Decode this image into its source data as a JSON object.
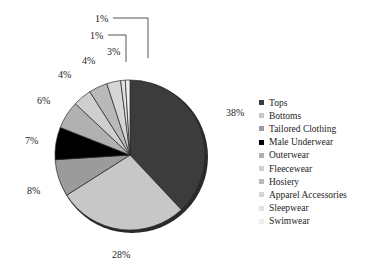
{
  "chart_data": {
    "type": "pie",
    "title": "",
    "legend_position": "right",
    "labels": [
      "Tops",
      "Bottoms",
      "Tailored Clothing",
      "Male Underwear",
      "Outerwear",
      "Fleecewear",
      "Hosiery",
      "Apparel Accessories",
      "Sleepwear",
      "Swimwear"
    ],
    "values": [
      38,
      28,
      8,
      7,
      6,
      4,
      4,
      3,
      1,
      1
    ],
    "value_labels": [
      "38%",
      "28%",
      "8%",
      "7%",
      "6%",
      "4%",
      "4%",
      "3%",
      "1%",
      "1%"
    ],
    "colors": [
      "#3c3c3c",
      "#c7c7c7",
      "#9b9b9b",
      "#000000",
      "#b1b1b1",
      "#cfcfcf",
      "#b9b9b9",
      "#d6d6d6",
      "#e2e2e2",
      "#ededed"
    ],
    "start_angle_deg": 0,
    "direction": "clockwise",
    "slice_outline_color": "#2a2a2a"
  },
  "legend": {
    "items": [
      {
        "label": "Tops",
        "color": "#3c3c3c"
      },
      {
        "label": "Bottoms",
        "color": "#c7c7c7"
      },
      {
        "label": "Tailored Clothing",
        "color": "#9b9b9b"
      },
      {
        "label": "Male Underwear",
        "color": "#000000"
      },
      {
        "label": "Outerwear",
        "color": "#b1b1b1"
      },
      {
        "label": "Fleecewear",
        "color": "#cfcfcf"
      },
      {
        "label": "Hosiery",
        "color": "#b9b9b9"
      },
      {
        "label": "Apparel Accessories",
        "color": "#d6d6d6"
      },
      {
        "label": "Sleepwear",
        "color": "#e2e2e2"
      },
      {
        "label": "Swimwear",
        "color": "#ededed"
      }
    ]
  },
  "callout_labels": [
    {
      "text": "38%",
      "x": 226,
      "y": 108
    },
    {
      "text": "28%",
      "x": 112,
      "y": 250
    },
    {
      "text": "8%",
      "x": 27,
      "y": 186
    },
    {
      "text": "7%",
      "x": 25,
      "y": 136
    },
    {
      "text": "6%",
      "x": 37,
      "y": 96
    },
    {
      "text": "4%",
      "x": 58,
      "y": 70
    },
    {
      "text": "4%",
      "x": 82,
      "y": 56
    },
    {
      "text": "3%",
      "x": 107,
      "y": 47
    },
    {
      "text": "1%",
      "x": 90,
      "y": 31
    },
    {
      "text": "1%",
      "x": 95,
      "y": 14
    }
  ]
}
